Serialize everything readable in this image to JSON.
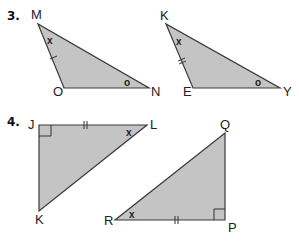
{
  "problems": [
    {
      "number": "3.",
      "triangles": [
        {
          "name": "MON",
          "vertices": {
            "M": "M",
            "O": "O",
            "N": "N"
          },
          "angle_marks": {
            "at_M": "x",
            "at_N": "o"
          },
          "side_marks": {
            "MO": "single tick"
          }
        },
        {
          "name": "KEY",
          "vertices": {
            "K": "K",
            "E": "E",
            "Y": "Y"
          },
          "angle_marks": {
            "at_K": "x",
            "at_Y": "o"
          },
          "side_marks": {
            "KE": "double tick"
          }
        }
      ]
    },
    {
      "number": "4.",
      "triangles": [
        {
          "name": "JKL",
          "vertices": {
            "J": "J",
            "K": "K",
            "L": "L"
          },
          "right_angle_at": "J",
          "angle_marks": {
            "at_L": "x"
          },
          "side_marks": {
            "JL": "double tick"
          }
        },
        {
          "name": "RPQ",
          "vertices": {
            "R": "R",
            "P": "P",
            "Q": "Q"
          },
          "right_angle_at": "P",
          "angle_marks": {
            "at_R": "x"
          },
          "side_marks": {
            "RP": "double tick"
          }
        }
      ]
    }
  ],
  "colors": {
    "fill": "#c4c4c4",
    "stroke": "#3a3a3a"
  }
}
